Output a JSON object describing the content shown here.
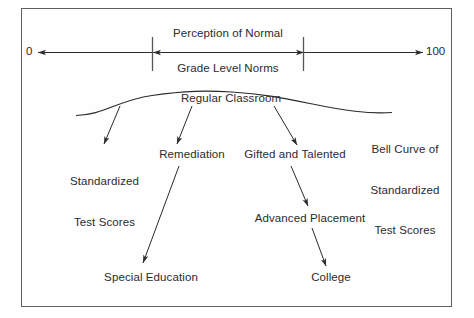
{
  "diagram": {
    "frame": {
      "border_color": "#5d5f62",
      "background": "#ffffff"
    },
    "ink_color": "#2b2b2e",
    "scale_axis": {
      "left_value": "0",
      "right_value": "100",
      "above_label": "Perception of Normal",
      "below_label": "Grade Level Norms"
    },
    "curve": {
      "caption_line1": "Bell Curve of",
      "caption_line2": "Standardized",
      "caption_line3": "Test Scores"
    },
    "nodes": {
      "regular_classroom": "Regular Classroom",
      "standardized_test_scores_line1": "Standardized",
      "standardized_test_scores_line2": "Test Scores",
      "remediation": "Remediation",
      "gifted_and_talented": "Gifted and Talented",
      "advanced_placement": "Advanced Placement",
      "special_education": "Special Education",
      "college": "College"
    },
    "edges": [
      {
        "from": "regular_classroom",
        "to": "standardized_test_scores"
      },
      {
        "from": "regular_classroom",
        "to": "remediation"
      },
      {
        "from": "regular_classroom",
        "to": "gifted_and_talented"
      },
      {
        "from": "remediation",
        "to": "special_education"
      },
      {
        "from": "gifted_and_talented",
        "to": "advanced_placement"
      },
      {
        "from": "advanced_placement",
        "to": "college"
      }
    ]
  }
}
